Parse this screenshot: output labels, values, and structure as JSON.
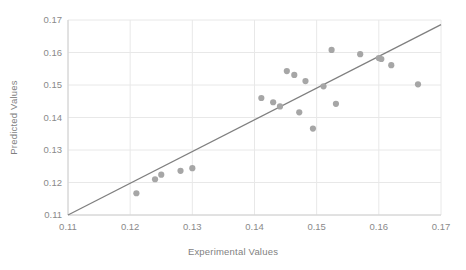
{
  "chart_data": {
    "type": "scatter",
    "title": "",
    "xlabel": "Experimental Values",
    "ylabel": "Predicted Values",
    "xlim": [
      0.11,
      0.17
    ],
    "ylim": [
      0.11,
      0.17
    ],
    "xticks": [
      "0.11",
      "0.12",
      "0.13",
      "0.14",
      "0.15",
      "0.16",
      "0.17"
    ],
    "yticks": [
      "0.11",
      "0.12",
      "0.13",
      "0.14",
      "0.15",
      "0.16",
      "0.17"
    ],
    "grid": true,
    "legend": false,
    "point_color": "#a6a6a6",
    "line_color": "#7f7f7f",
    "grid_color": "#e8e8e8",
    "series": [
      {
        "name": "Predicted vs Experimental",
        "x": [
          0.121,
          0.124,
          0.125,
          0.1281,
          0.13,
          0.1411,
          0.143,
          0.1441,
          0.1452,
          0.1464,
          0.1472,
          0.1482,
          0.1494,
          0.1511,
          0.1524,
          0.1531,
          0.157,
          0.16,
          0.1604,
          0.162,
          0.1663
        ],
        "y": [
          0.1167,
          0.121,
          0.1224,
          0.1236,
          0.1244,
          0.146,
          0.1447,
          0.1434,
          0.1543,
          0.1531,
          0.1416,
          0.1512,
          0.1366,
          0.1496,
          0.1608,
          0.1442,
          0.1595,
          0.1583,
          0.158,
          0.1561,
          0.1502
        ]
      }
    ],
    "reference_line": {
      "name": "identity-line",
      "x1": 0.11,
      "y1": 0.11,
      "x2": 0.17,
      "y2": 0.1686
    }
  }
}
